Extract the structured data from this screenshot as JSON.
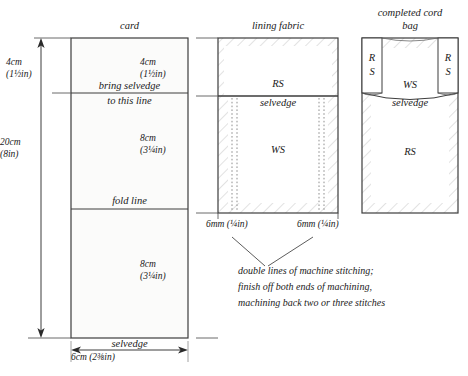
{
  "figure": {
    "type": "sewing-pattern-diagram",
    "panels": [
      {
        "id": "card",
        "title": "card",
        "labels": [
          "bring selvedge",
          "to this line",
          "fold line"
        ],
        "bottom_label": "selvedge",
        "bottom_dimension": "6cm (2⅜in)"
      },
      {
        "id": "lining-fabric",
        "title": "lining fabric",
        "top_face": "RS",
        "selvedge_label": "selvedge",
        "body_face": "WS",
        "seam_left": "6mm (¼in)",
        "seam_right": "6mm (¼in)"
      },
      {
        "id": "completed-cord-bag",
        "title_line1": "completed cord",
        "title_line2": "bag",
        "flap_left_line1": "R",
        "flap_left_line2": "S",
        "flap_right_line1": "R",
        "flap_right_line2": "S",
        "inner_face": "WS",
        "selvedge_label": "selvedge",
        "body_face": "RS"
      }
    ],
    "dimensions": {
      "left_total_cm": "20cm",
      "left_total_in": "(8in)",
      "card_top_cm": "4cm",
      "card_top_in": "(1½in)",
      "lining_top_cm": "4cm",
      "lining_top_in": "(1½in)",
      "mid_cm": "8cm",
      "mid_in": "(3¼in)",
      "lower_cm": "8cm",
      "lower_in": "(3¼in)"
    },
    "caption": {
      "line1": "double lines of machine stitching;",
      "line2": "finish off both ends of machining,",
      "line3": "machining back two or three stitches"
    },
    "colors": {
      "ink": "#1a1a1a",
      "rule": "#4a4a4a",
      "hatch": "#b8b8b8",
      "panel_fill": "#fbfbfa",
      "stitch": "#9a9a9a"
    }
  }
}
